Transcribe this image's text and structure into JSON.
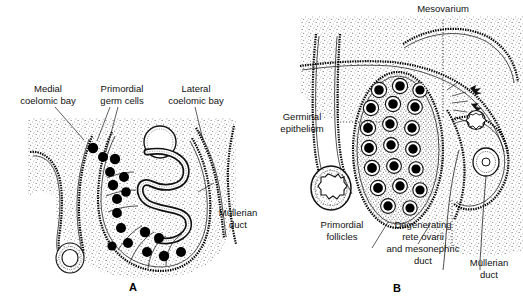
{
  "figure": {
    "title_text": "",
    "panels": [
      {
        "letter": "A",
        "name": "indifferent-gonad-panel",
        "labels": [
          {
            "id": "medial-coelomic-bay",
            "lines": [
              "Medial",
              "coelomic bay"
            ]
          },
          {
            "id": "primordial-germ-cells",
            "lines": [
              "Primordial",
              "germ cells"
            ]
          },
          {
            "id": "lateral-coelomic-bay",
            "lines": [
              "Lateral",
              "coelomic bay"
            ]
          },
          {
            "id": "mullerian-duct",
            "lines": [
              "Müllerian",
              "duct"
            ]
          }
        ]
      },
      {
        "letter": "B",
        "name": "developing-ovary-panel",
        "labels": [
          {
            "id": "mesovarium",
            "lines": [
              "Mesovarium"
            ]
          },
          {
            "id": "germinal-epithelium",
            "lines": [
              "Germinal",
              "epithelium"
            ]
          },
          {
            "id": "primordial-follicles",
            "lines": [
              "Primordial",
              "follicles"
            ]
          },
          {
            "id": "degenerating-rete-ovarii",
            "lines": [
              "Degenerating",
              "rete ovarii",
              "and mesonephric",
              "duct"
            ]
          },
          {
            "id": "mullerian-duct-b",
            "lines": [
              "Müllerian",
              "duct"
            ]
          }
        ]
      }
    ],
    "colors": {
      "ink": "#111111",
      "stipple": "#555555",
      "background": "#ffffff",
      "germ_cell": "#000000"
    },
    "label_text": {
      "medial_1": "Medial",
      "medial_2": "coelomic bay",
      "primordial_germ_1": "Primordial",
      "primordial_germ_2": "germ cells",
      "lateral_1": "Lateral",
      "lateral_2": "coelomic bay",
      "mullerian_a_1": "Müllerian",
      "mullerian_a_2": "duct",
      "mesovarium": "Mesovarium",
      "germinal_1": "Germinal",
      "germinal_2": "epithelium",
      "primordial_foll_1": "Primordial",
      "primordial_foll_2": "follicles",
      "degen_1": "Degenerating",
      "degen_2": "rete ovarii",
      "degen_3": "and mesonephric",
      "degen_4": "duct",
      "mullerian_b_1": "Müllerian",
      "mullerian_b_2": "duct",
      "letter_a": "A",
      "letter_b": "B"
    }
  }
}
